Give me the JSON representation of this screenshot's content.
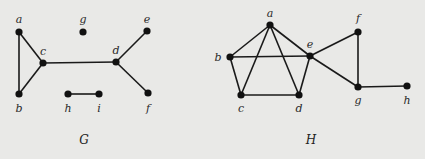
{
  "figure": {
    "background": "#e9e9e7",
    "edge_color": "#1a1a1a",
    "node_color": "#111111"
  },
  "graphs": [
    {
      "name": "G",
      "label": "G",
      "label_pos": [
        84,
        144
      ],
      "vertices": [
        {
          "id": "a",
          "label": "a",
          "x": 19,
          "y": 32,
          "lx": 19,
          "ly": 23
        },
        {
          "id": "b",
          "label": "b",
          "x": 19,
          "y": 94,
          "lx": 19,
          "ly": 112
        },
        {
          "id": "c",
          "label": "c",
          "x": 43,
          "y": 63,
          "lx": 43,
          "ly": 55
        },
        {
          "id": "g",
          "label": "g",
          "x": 83,
          "y": 32,
          "lx": 83,
          "ly": 23
        },
        {
          "id": "d",
          "label": "d",
          "x": 116,
          "y": 62,
          "lx": 116,
          "ly": 54
        },
        {
          "id": "e",
          "label": "e",
          "x": 147,
          "y": 31,
          "lx": 147,
          "ly": 23
        },
        {
          "id": "f",
          "label": "f",
          "x": 148,
          "y": 93,
          "lx": 148,
          "ly": 112
        },
        {
          "id": "h",
          "label": "h",
          "x": 68,
          "y": 94,
          "lx": 68,
          "ly": 112
        },
        {
          "id": "i",
          "label": "i",
          "x": 99,
          "y": 94,
          "lx": 99,
          "ly": 112
        }
      ],
      "edges": [
        [
          "a",
          "b"
        ],
        [
          "a",
          "c"
        ],
        [
          "b",
          "c"
        ],
        [
          "c",
          "d"
        ],
        [
          "d",
          "e"
        ],
        [
          "d",
          "f"
        ],
        [
          "h",
          "i"
        ]
      ]
    },
    {
      "name": "H",
      "label": "H",
      "label_pos": [
        311,
        144
      ],
      "vertices": [
        {
          "id": "a",
          "label": "a",
          "x": 270,
          "y": 25,
          "lx": 270,
          "ly": 17
        },
        {
          "id": "b",
          "label": "b",
          "x": 230,
          "y": 57,
          "lx": 218,
          "ly": 61
        },
        {
          "id": "c",
          "label": "c",
          "x": 241,
          "y": 95,
          "lx": 241,
          "ly": 112
        },
        {
          "id": "d",
          "label": "d",
          "x": 299,
          "y": 95,
          "lx": 299,
          "ly": 112
        },
        {
          "id": "e",
          "label": "e",
          "x": 310,
          "y": 56,
          "lx": 310,
          "ly": 48
        },
        {
          "id": "f",
          "label": "f",
          "x": 358,
          "y": 32,
          "lx": 358,
          "ly": 22
        },
        {
          "id": "g",
          "label": "g",
          "x": 358,
          "y": 87,
          "lx": 358,
          "ly": 104
        },
        {
          "id": "h",
          "label": "h",
          "x": 407,
          "y": 86,
          "lx": 407,
          "ly": 104
        }
      ],
      "edges": [
        [
          "a",
          "b"
        ],
        [
          "a",
          "c"
        ],
        [
          "a",
          "d"
        ],
        [
          "a",
          "e"
        ],
        [
          "b",
          "e"
        ],
        [
          "b",
          "c"
        ],
        [
          "c",
          "d"
        ],
        [
          "d",
          "e"
        ],
        [
          "e",
          "f"
        ],
        [
          "e",
          "g"
        ],
        [
          "f",
          "g"
        ],
        [
          "g",
          "h"
        ]
      ]
    }
  ]
}
